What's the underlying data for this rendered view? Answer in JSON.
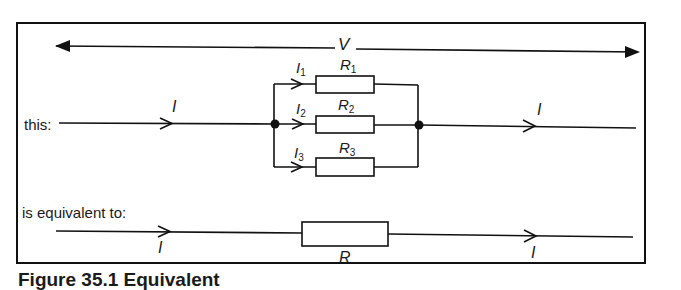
{
  "diagram": {
    "voltage_label": "V",
    "top_row": {
      "label": "this:",
      "current_in": "I",
      "current_out": "I",
      "branches": [
        {
          "current": "I",
          "current_sub": "1",
          "resistor": "R",
          "resistor_sub": "1"
        },
        {
          "current": "I",
          "current_sub": "2",
          "resistor": "R",
          "resistor_sub": "2"
        },
        {
          "current": "I",
          "current_sub": "3",
          "resistor": "R",
          "resistor_sub": "3"
        }
      ]
    },
    "bottom_row": {
      "label": "is equivalent to:",
      "current_in": "I",
      "current_out": "I",
      "resistor": "R"
    },
    "caption": "Figure 35.1  Equivalent"
  }
}
